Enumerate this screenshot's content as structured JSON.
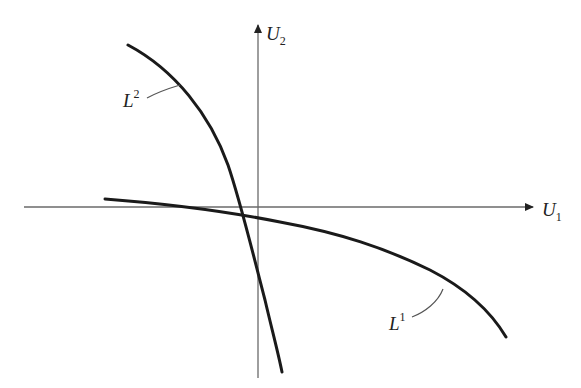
{
  "diagram": {
    "type": "utility-possibility-curves",
    "axes": {
      "x": {
        "label": "U",
        "subscript": "1"
      },
      "y": {
        "label": "U",
        "subscript": "2"
      }
    },
    "curves": [
      {
        "id": "L1",
        "label": "L",
        "superscript": "1",
        "description": "flat, concave curve crossing the U1 axis slightly left of the origin"
      },
      {
        "id": "L2",
        "label": "L",
        "superscript": "2",
        "description": "steep, concave curve crossing the U1 axis slightly left of the origin"
      }
    ],
    "colors": {
      "axis": "#6a6a6a",
      "curve": "#1a1a1a",
      "background": "#ffffff"
    }
  }
}
